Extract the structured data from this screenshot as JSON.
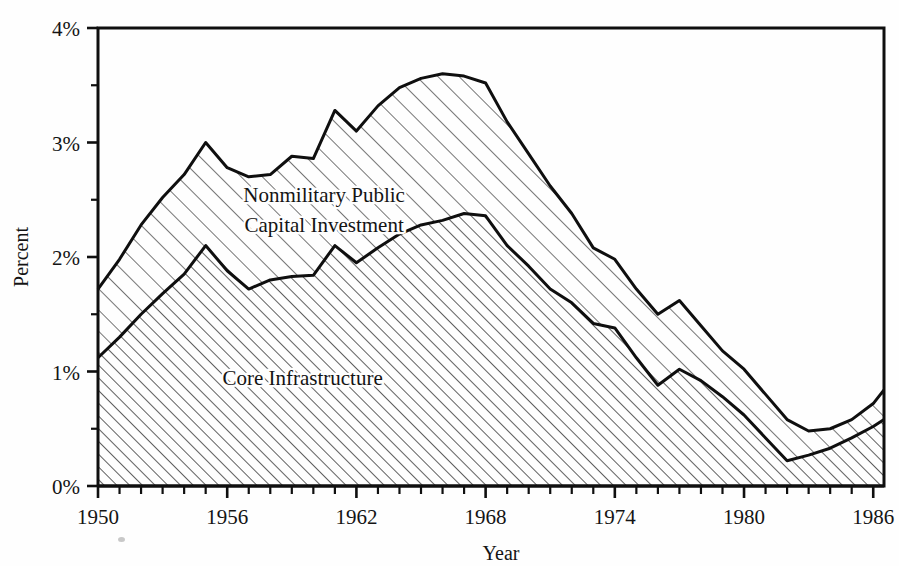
{
  "chart_data": {
    "type": "area",
    "stacked": true,
    "title": "",
    "xlabel": "Year",
    "ylabel": "Percent",
    "xlim": [
      1950,
      1986.5
    ],
    "ylim": [
      0,
      4
    ],
    "ytick_labels": [
      "0%",
      "1%",
      "2%",
      "3%",
      "4%"
    ],
    "ytick_values": [
      0,
      1,
      2,
      3,
      4
    ],
    "yminor_step": 0.5,
    "xtick_labels": [
      "1950",
      "1956",
      "1962",
      "1968",
      "1974",
      "1980",
      "1986"
    ],
    "xtick_values": [
      1950,
      1956,
      1962,
      1968,
      1974,
      1980,
      1986
    ],
    "xminor_step": 1,
    "grid": false,
    "legend_position": "inline-annotations",
    "x": [
      1950,
      1951,
      1952,
      1953,
      1954,
      1955,
      1956,
      1957,
      1958,
      1959,
      1960,
      1961,
      1962,
      1963,
      1964,
      1965,
      1966,
      1967,
      1968,
      1969,
      1970,
      1971,
      1972,
      1973,
      1974,
      1975,
      1976,
      1977,
      1978,
      1979,
      1980,
      1981,
      1982,
      1983,
      1984,
      1985,
      1986,
      1986.5
    ],
    "series": [
      {
        "name": "Core Infrastructure",
        "label": "Core Infrastructure",
        "hatch": "diagonal-dense",
        "values": [
          1.12,
          1.3,
          1.5,
          1.68,
          1.85,
          2.1,
          1.88,
          1.72,
          1.8,
          1.83,
          1.84,
          2.1,
          1.95,
          2.08,
          2.2,
          2.28,
          2.32,
          2.38,
          2.36,
          2.1,
          1.92,
          1.72,
          1.6,
          1.42,
          1.38,
          1.12,
          0.88,
          1.02,
          0.92,
          0.78,
          0.62,
          0.42,
          0.22,
          0.27,
          0.33,
          0.42,
          0.52,
          0.58
        ]
      },
      {
        "name": "Nonmilitary Public Capital Investment",
        "label": "Nonmilitary Public\nCapital Investment",
        "hatch": "diagonal-sparse",
        "values": [
          1.72,
          1.98,
          2.28,
          2.52,
          2.72,
          3.0,
          2.78,
          2.7,
          2.72,
          2.88,
          2.86,
          3.28,
          3.1,
          3.32,
          3.48,
          3.56,
          3.6,
          3.58,
          3.52,
          3.18,
          2.9,
          2.62,
          2.38,
          2.08,
          1.98,
          1.72,
          1.5,
          1.62,
          1.4,
          1.18,
          1.02,
          0.8,
          0.58,
          0.48,
          0.5,
          0.58,
          0.72,
          0.84
        ]
      }
    ],
    "annotations": [
      {
        "name": "upper-band-label",
        "text_line1": "Nonmilitary Public",
        "text_line2": "Capital Investment",
        "x": 1960.5,
        "y": 2.48
      },
      {
        "name": "lower-band-label",
        "text_line1": "Core Infrastructure",
        "text_line2": "",
        "x": 1959.5,
        "y": 0.88
      }
    ]
  },
  "axis": {
    "y_title": "Percent",
    "x_title": "Year"
  },
  "colors": {
    "ink": "#141414",
    "paper": "#fefefe",
    "hatch": "#3a3a3a"
  }
}
